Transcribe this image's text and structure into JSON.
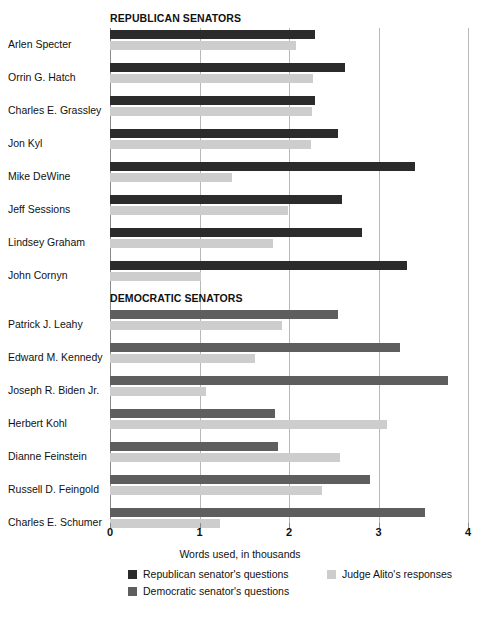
{
  "chart_data": {
    "type": "bar",
    "orientation": "horizontal",
    "title": "",
    "xlabel": "Words used, in thousands",
    "ylabel": "",
    "xlim": [
      0,
      4
    ],
    "xticks": [
      0,
      1,
      2,
      3,
      4
    ],
    "xtick_labels": [
      "0",
      "1",
      "2",
      "3",
      "4"
    ],
    "grid": true,
    "grid_axis": "x",
    "legend_position": "bottom",
    "sections": [
      {
        "title": "REPUBLICAN SENATORS",
        "questioner_series": "Republican senator's questions",
        "rows": [
          {
            "label": "Arlen Specter",
            "questions": 2.29,
            "responses": 2.08
          },
          {
            "label": "Orrin G. Hatch",
            "questions": 2.63,
            "responses": 2.27
          },
          {
            "label": "Charles E. Grassley",
            "questions": 2.29,
            "responses": 2.26
          },
          {
            "label": "Jon Kyl",
            "questions": 2.55,
            "responses": 2.25
          },
          {
            "label": "Mike DeWine",
            "questions": 3.41,
            "responses": 1.36
          },
          {
            "label": "Jeff Sessions",
            "questions": 2.59,
            "responses": 1.99
          },
          {
            "label": "Lindsey Graham",
            "questions": 2.82,
            "responses": 1.82
          },
          {
            "label": "John Cornyn",
            "questions": 3.32,
            "responses": 1.02
          }
        ]
      },
      {
        "title": "DEMOCRATIC SENATORS",
        "questioner_series": "Democratic senator's questions",
        "rows": [
          {
            "label": "Patrick J. Leahy",
            "questions": 2.55,
            "responses": 1.92
          },
          {
            "label": "Edward M. Kennedy",
            "questions": 3.24,
            "responses": 1.62
          },
          {
            "label": "Joseph R. Biden Jr.",
            "questions": 3.78,
            "responses": 1.07
          },
          {
            "label": "Herbert Kohl",
            "questions": 1.84,
            "responses": 3.09
          },
          {
            "label": "Dianne Feinstein",
            "questions": 1.88,
            "responses": 2.57
          },
          {
            "label": "Russell D. Feingold",
            "questions": 2.91,
            "responses": 2.37
          },
          {
            "label": "Charles E. Schumer",
            "questions": 3.52,
            "responses": 1.23
          }
        ]
      }
    ],
    "legend": [
      {
        "key": "rep",
        "label": "Republican senator's questions",
        "color": "#2b2b2b"
      },
      {
        "key": "dem",
        "label": "Democratic senator's questions",
        "color": "#5e5e5e"
      },
      {
        "key": "alito",
        "label": "Judge Alito's responses",
        "color": "#cdcdcd"
      }
    ]
  },
  "colors": {
    "republican": "#2b2b2b",
    "democratic": "#5e5e5e",
    "alito": "#cdcdcd",
    "gridline": "#b8b8b8",
    "text": "#111111",
    "background": "#ffffff"
  }
}
